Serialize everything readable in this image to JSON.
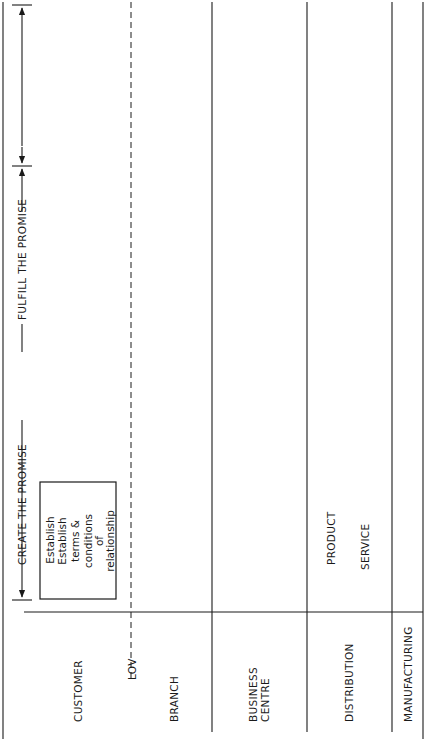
{
  "orientation": "rotated-90-ccw",
  "phases": {
    "create": "CREATE THE PROMISE",
    "fulfill": "FULFILL THE PROMISE"
  },
  "lanes": [
    {
      "id": "customer",
      "label": "CUSTOMER"
    },
    {
      "id": "lov",
      "label": "LOV"
    },
    {
      "id": "branch",
      "label": "BRANCH"
    },
    {
      "id": "business_centre",
      "label": "BUSINESS CENTRE",
      "lines": [
        "BUSINESS",
        "CENTRE"
      ]
    },
    {
      "id": "distribution",
      "label": "DISTRIBUTION",
      "sublabels": [
        "PRODUCT",
        "SERVICE"
      ]
    },
    {
      "id": "manufacturing",
      "label": "MANUFACTURING"
    }
  ],
  "boxes": {
    "establish": [
      "Establish",
      "terms &",
      "conditions",
      "of",
      "relationship"
    ],
    "request_proposal": [
      "Request",
      "solution",
      "proposal"
    ],
    "order_solution": [
      "Order",
      "solution"
    ],
    "request_status": [
      "Request",
      "fulfill",
      "status"
    ],
    "receive_solution": [
      "Receive",
      "solution"
    ],
    "make_payment": [
      "Make",
      "payment"
    ],
    "order_help": [
      "Order",
      "\"help\""
    ],
    "provide_terms": [
      "Provide",
      "terms",
      "custom",
      "(bid)"
    ],
    "provide_terms_std": "standard",
    "design_solution": [
      "Design",
      "solution",
      "(offer",
      "&",
      "prices)"
    ],
    "design_custom_tab": [
      "C",
      "u",
      "s",
      "t",
      "o",
      "m"
    ],
    "design_std_tab": [
      "S",
      "t",
      "d."
    ],
    "inst_sol": [
      "Inst.",
      "sol."
    ],
    "process_order": [
      "Process",
      "solution",
      "order"
    ],
    "synchro_delivery": [
      "Synchro.",
      "solution",
      "delivery",
      "request"
    ],
    "order_payment": [
      "Order",
      "payment"
    ],
    "fulfill_tangible": [
      "Fulfill",
      "tangible",
      "order"
    ],
    "synchro_physical": [
      "Synchro.",
      "solution",
      "physical",
      "distribution"
    ],
    "prod_tag": "Prod.",
    "service_tag": "Service",
    "supply": "Supply"
  },
  "flow_labels": {
    "invoice": "Invoice",
    "query": "Query",
    "assign_staff": [
      "Assign",
      "Staff"
    ],
    "inq": "Inq.",
    "terms_detail": "Terms detail",
    "solution_detail": [
      "Solution",
      "detail"
    ],
    "contract_detail": [
      "Contract",
      "detail"
    ],
    "prod_serv": "Prod/Serv",
    "sched_detail": [
      "Sched.",
      "Detail"
    ],
    "trans_detail": [
      "Trans",
      "Detail"
    ],
    "sourcing": "Sourcing"
  }
}
